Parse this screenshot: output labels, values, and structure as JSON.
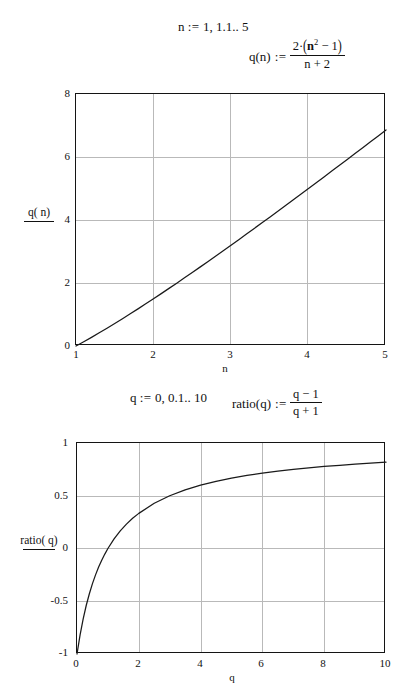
{
  "document": {
    "title": "Mathcad worksheet — q(n) and ratio(q) plots"
  },
  "definitions": {
    "range_n": {
      "lhs": "n",
      "assign": ":=",
      "rhs": "1, 1.1.. 5",
      "full_text": "n := 1, 1.1.. 5"
    },
    "function_q": {
      "lhs": "q(n)",
      "assign": ":=",
      "numerator_coeff": "2·",
      "numerator_open": "(",
      "numerator_base": "n",
      "numerator_exp": "2",
      "numerator_rest": " − 1",
      "numerator_close": ")",
      "denominator": "n + 2",
      "full_text": "q(n) := 2·(n² − 1) / (n + 2)"
    },
    "range_q": {
      "lhs": "q",
      "assign": ":=",
      "rhs": "0, 0.1.. 10",
      "full_text": "q := 0, 0.1.. 10"
    },
    "function_ratio": {
      "lhs": "ratio(q)",
      "assign": ":=",
      "numerator": "q − 1",
      "denominator": "q + 1",
      "full_text": "ratio(q) := (q − 1) / (q + 1)"
    }
  },
  "chart_data": [
    {
      "id": "plot-q-of-n",
      "type": "line",
      "title": "",
      "xlabel": "n",
      "ylabel": "q(n)",
      "trace_label": "q( n)",
      "xlim": [
        1,
        5
      ],
      "ylim": [
        0,
        8
      ],
      "xticks": [
        "1",
        "2",
        "3",
        "4",
        "5"
      ],
      "xtick_values": [
        1,
        2,
        3,
        4,
        5
      ],
      "yticks": [
        "0",
        "2",
        "4",
        "6",
        "8"
      ],
      "ytick_values": [
        0,
        2,
        4,
        6,
        8
      ],
      "grid": true,
      "legend": "none",
      "x": [
        1,
        1.1,
        1.2,
        1.3,
        1.4,
        1.5,
        1.6,
        1.7,
        1.8,
        1.9,
        2,
        2.1,
        2.2,
        2.3,
        2.4,
        2.5,
        2.6,
        2.7,
        2.8,
        2.9,
        3,
        3.1,
        3.2,
        3.3,
        3.4,
        3.5,
        3.6,
        3.7,
        3.8,
        3.9,
        4,
        4.1,
        4.2,
        4.3,
        4.4,
        4.5,
        4.6,
        4.7,
        4.8,
        4.9,
        5
      ],
      "values": [
        0,
        0.135,
        0.275,
        0.42,
        0.565,
        0.714,
        0.867,
        1.022,
        1.179,
        1.338,
        1.5,
        1.663,
        1.829,
        1.995,
        2.164,
        2.333,
        2.504,
        2.677,
        2.85,
        3.024,
        3.2,
        3.376,
        3.553,
        3.732,
        3.911,
        4.091,
        4.271,
        4.453,
        4.635,
        4.817,
        5,
        5.184,
        5.368,
        5.552,
        5.738,
        5.923,
        6.109,
        6.296,
        6.482,
        6.67,
        6.857
      ]
    },
    {
      "id": "plot-ratio-of-q",
      "type": "line",
      "title": "",
      "xlabel": "q",
      "ylabel": "ratio(q)",
      "trace_label": "ratio( q)",
      "xlim": [
        0,
        10
      ],
      "ylim": [
        -1,
        1
      ],
      "xticks": [
        "0",
        "2",
        "4",
        "6",
        "8",
        "10"
      ],
      "xtick_values": [
        0,
        2,
        4,
        6,
        8,
        10
      ],
      "yticks": [
        "1",
        "0.5",
        "0",
        "-0.5",
        "-1"
      ],
      "ytick_values": [
        1,
        0.5,
        0,
        -0.5,
        -1
      ],
      "grid": true,
      "legend": "none",
      "x": [
        0,
        0.1,
        0.2,
        0.3,
        0.4,
        0.5,
        0.6,
        0.7,
        0.8,
        0.9,
        1,
        1.2,
        1.4,
        1.6,
        1.8,
        2,
        2.5,
        3,
        3.5,
        4,
        4.5,
        5,
        5.5,
        6,
        6.5,
        7,
        7.5,
        8,
        8.5,
        9,
        9.5,
        10
      ],
      "values": [
        -1,
        -0.818,
        -0.667,
        -0.538,
        -0.429,
        -0.333,
        -0.25,
        -0.176,
        -0.111,
        -0.053,
        0,
        0.091,
        0.167,
        0.231,
        0.286,
        0.333,
        0.429,
        0.5,
        0.556,
        0.6,
        0.636,
        0.667,
        0.692,
        0.714,
        0.733,
        0.75,
        0.765,
        0.778,
        0.789,
        0.8,
        0.81,
        0.818
      ]
    }
  ],
  "colors": {
    "frame": "#141414",
    "grid": "#b9b9b9",
    "curve": "#1a1a1a",
    "text": "#111111",
    "background": "#ffffff"
  }
}
